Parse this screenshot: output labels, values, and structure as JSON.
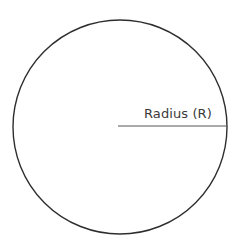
{
  "canvas": {
    "width": 239,
    "height": 252,
    "background_color": "#ffffff"
  },
  "diagram": {
    "type": "geometry-diagram"
  },
  "circle": {
    "center_x": 120,
    "center_y": 127,
    "radius": 107,
    "stroke_color": "#2e2e2e",
    "stroke_width": 1.4,
    "fill": "none"
  },
  "radius_line": {
    "x1": 118,
    "y1": 126,
    "x2": 227,
    "y2": 126,
    "stroke_color": "#555555",
    "stroke_width": 1
  },
  "labels": {
    "radius": {
      "text": "Radius (R)",
      "color": "#3a3a3a",
      "font_size": 13,
      "x": 144,
      "y": 106
    }
  }
}
